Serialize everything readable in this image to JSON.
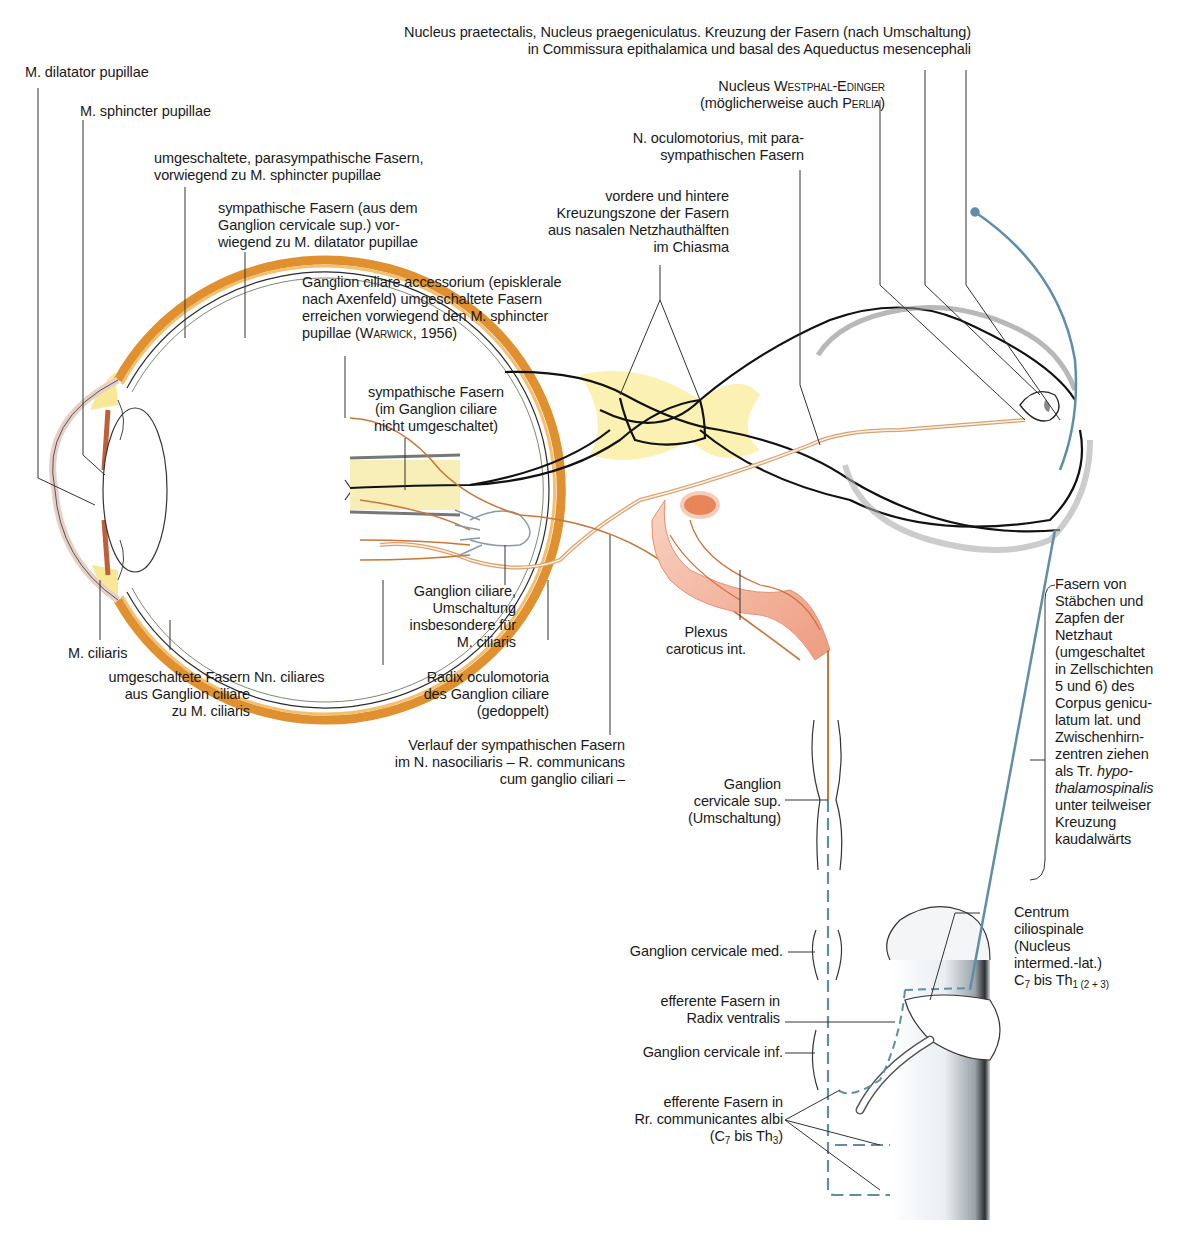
{
  "figure": {
    "colors": {
      "parasympathetic_fibre": "#c8773a",
      "sympathetic_fibre": "#5f8ea8",
      "optic_pathway": "#1a1a1a",
      "sclera_orange": "#e0902e",
      "chiasma_yellow": "#f5e46a",
      "carotid_pink": "#f2a68a",
      "label_text": "#1a1a1a"
    }
  },
  "labels": {
    "nucleus_praetectalis": "Nucleus praetectalis, Nucleus praegeniculatus. Kreuzung der Fasern (nach Umschaltung)\nin Commissura epithalamica und basal des Aqueductus mesencephali",
    "m_dilatator": "M. dilatator pupillae",
    "m_sphincter": "M. sphincter pupillae",
    "parasymp_fasern": "umgeschaltete, parasympathische Fasern,\nvorwiegend zu M. sphincter pupillae",
    "symp_fasern_dilatator": "sympathische Fasern (aus dem\nGanglion cervicale sup.) vor-\nwiegend zu M. dilatator pupillae",
    "westphal_line1_a": "Nucleus ",
    "westphal_line1_b": "Westphal-Edinger",
    "westphal_line2_a": "(möglicherweise auch ",
    "westphal_line2_b": "Perlia",
    "westphal_line2_c": ")",
    "n_oculomotorius": "N. oculomotorius, mit para-\nsympathischen Fasern",
    "kreuzungszone": "vordere und hintere\nKreuzungszone der Fasern\naus nasalen Netzhauthälften\nim Chiasma",
    "ganglion_accessorium_a": "Ganglion ciliare accessorium (episklerale\nnach Axenfeld) umgeschaltete Fasern\nerreichen vorwiegend den M. sphincter\npupillae (",
    "ganglion_accessorium_b": "Warwick",
    "ganglion_accessorium_c": ", 1956)",
    "symp_nicht_umgeschaltet": "sympathische Fasern\n(im Ganglion ciliare\nnicht umgeschaltet)",
    "m_ciliaris": "M. ciliaris",
    "umgeschaltete_ciliaris": "umgeschaltete Fasern\naus Ganglion ciliare\nzu M. ciliaris",
    "nn_ciliares": "Nn. ciliares",
    "ganglion_ciliare": "Ganglion ciliare,\nUmschaltung\ninsbesondere für\nM. ciliaris",
    "radix_oculomotoria": "Radix oculomotoria\ndes Ganglion ciliare\n(gedoppelt)",
    "plexus_caroticus": "Plexus\ncaroticus int.",
    "verlauf_symp": "Verlauf der sympathischen Fasern\nim N. nasociliaris – R. communicans\ncum ganglio ciliari –",
    "ganglion_cerv_sup": "Ganglion\ncervicale sup.\n(Umschaltung)",
    "fasern_staebchen_a": "Fasern von\nStäbchen und\nZapfen der\nNetzhaut\n(umgeschaltet\nin Zellschichten\n5 und 6) des\nCorpus genicu-\nlatum lat. und\nZwischenhirn-\nzentren ziehen\nals Tr. ",
    "fasern_staebchen_b": "hypo-\nthalamospinalis",
    "fasern_staebchen_c": "\nunter teilweiser\nKreuzung\nkaudalwärts",
    "ganglion_cerv_med": "Ganglion cervicale med.",
    "centrum_ciliospinale": "Centrum\nciliospinale\n(Nucleus\nintermed.-lat.)",
    "centrum_segment_a": "C",
    "centrum_segment_b": "7",
    "centrum_segment_c": " bis Th",
    "centrum_segment_d": "1 (2 + 3)",
    "efferente_radix": "efferente Fasern in\nRadix ventralis",
    "ganglion_cerv_inf": "Ganglion cervicale inf.",
    "efferente_rr": "efferente Fasern in\nRr. communicantes albi",
    "efferente_rr_seg_a": "(C",
    "efferente_rr_seg_b": "7",
    "efferente_rr_seg_c": " bis Th",
    "efferente_rr_seg_d": "3",
    "efferente_rr_seg_e": ")"
  }
}
